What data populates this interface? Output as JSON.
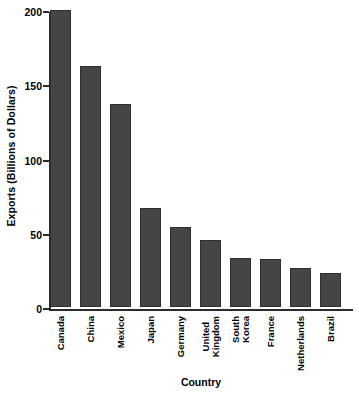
{
  "chart_data": {
    "type": "bar",
    "title": "",
    "xlabel": "Country",
    "ylabel": "Exports (Billions of Dollars)",
    "categories": [
      "Canada",
      "China",
      "Mexico",
      "Japan",
      "Germany",
      "United Kingdom",
      "South Korea",
      "France",
      "Netherlands",
      "Brazil"
    ],
    "values": [
      200,
      162,
      137,
      67,
      54,
      45,
      33,
      32,
      26,
      23
    ],
    "ylim": [
      0,
      200
    ],
    "yticks": [
      0,
      50,
      100,
      150,
      200
    ],
    "ytick_labels": [
      "0",
      "50",
      "100",
      "150",
      "200"
    ],
    "grid": false,
    "legend": false,
    "bar_color": "#454545",
    "bar_edge_color": "#2e2e2e",
    "axis_color": "#2b2b2b",
    "text_color": "#000000",
    "background": "#ffffff"
  }
}
